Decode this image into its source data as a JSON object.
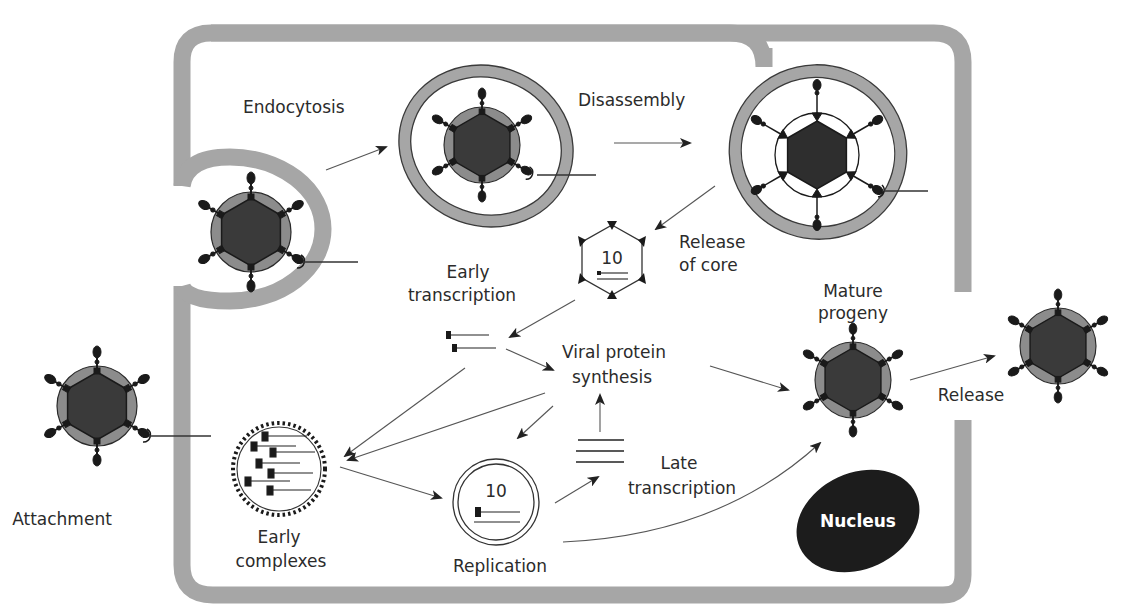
{
  "diagram": {
    "type": "virus-replication-cycle",
    "colors": {
      "membrane": "#a6a6a6",
      "capsid_core": "#3a3a3a",
      "capsid_shell": "#8c8c8c",
      "nucleus": "#1c1c1c",
      "arrow": "#555555",
      "text": "#2b2b2b",
      "background": "#ffffff"
    },
    "labels": {
      "endocytosis": "Endocytosis",
      "disassembly": "Disassembly",
      "release_of_core_1": "Release",
      "release_of_core_2": "of core",
      "early_transcription_1": "Early",
      "early_transcription_2": "transcription",
      "viral_protein_synthesis_1": "Viral protein",
      "viral_protein_synthesis_2": "synthesis",
      "mature_progeny_1": "Mature",
      "mature_progeny_2": "progeny",
      "release": "Release",
      "attachment": "Attachment",
      "early_complexes_1": "Early",
      "early_complexes_2": "complexes",
      "replication": "Replication",
      "late_transcription_1": "Late",
      "late_transcription_2": "transcription",
      "nucleus": "Nucleus"
    },
    "core_segment_count": "10",
    "replication_segment_count": "10",
    "stages": [
      "Attachment",
      "Endocytosis",
      "Disassembly",
      "Release of core",
      "Early transcription",
      "Viral protein synthesis",
      "Early complexes",
      "Replication",
      "Late transcription",
      "Mature progeny",
      "Release"
    ]
  }
}
